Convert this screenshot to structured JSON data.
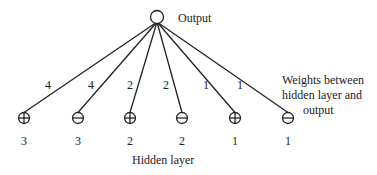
{
  "diagram": {
    "output_node": {
      "label": "Output",
      "x": 157,
      "y": 17
    },
    "hidden_layer_label": "Hidden layer",
    "weights_annotation": [
      "Weights between",
      "hidden layer and",
      "output"
    ],
    "hidden_nodes": [
      {
        "sign": "+",
        "x": 24,
        "value": "3",
        "weight": "4",
        "wx": 48,
        "wy": 89
      },
      {
        "sign": "-",
        "x": 78,
        "value": "3",
        "weight": "4",
        "wx": 91,
        "wy": 89
      },
      {
        "sign": "+",
        "x": 130,
        "value": "2",
        "weight": "2",
        "wx": 130,
        "wy": 89
      },
      {
        "sign": "-",
        "x": 182,
        "value": "2",
        "weight": "2",
        "wx": 166,
        "wy": 89
      },
      {
        "sign": "+",
        "x": 235,
        "value": "1",
        "weight": "1",
        "wx": 206,
        "wy": 89
      },
      {
        "sign": "-",
        "x": 288,
        "value": "1",
        "weight": "1",
        "wx": 240,
        "wy": 89
      }
    ]
  }
}
